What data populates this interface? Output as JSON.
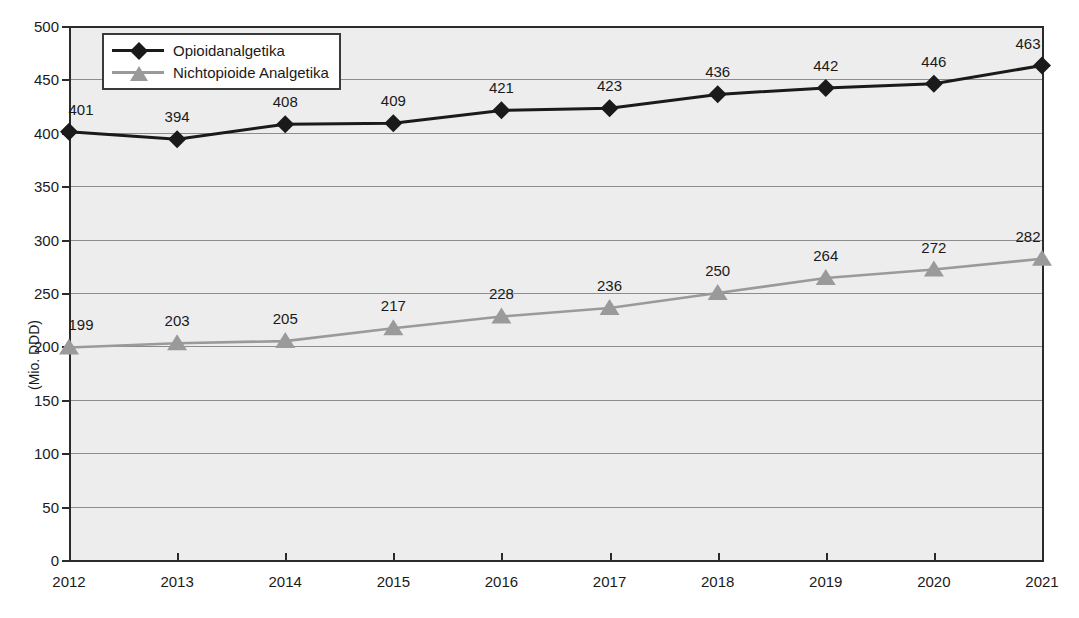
{
  "chart_data": {
    "type": "line",
    "title": "",
    "xlabel": "",
    "ylabel": "(Mio. DDD)",
    "categories": [
      "2012",
      "2013",
      "2014",
      "2015",
      "2016",
      "2017",
      "2018",
      "2019",
      "2020",
      "2021"
    ],
    "ylim": [
      0,
      500
    ],
    "yticks": [
      0,
      50,
      100,
      150,
      200,
      250,
      300,
      350,
      400,
      450,
      500
    ],
    "ytick_labels": [
      "0",
      "50",
      "100",
      "150",
      "200",
      "250",
      "300",
      "350",
      "400",
      "450",
      "500"
    ],
    "grid": true,
    "legend_position": "top-left",
    "series": [
      {
        "name": "Opioidanalgetika",
        "marker": "diamond",
        "color": "#1a1a1a",
        "values": [
          401,
          394,
          408,
          409,
          421,
          423,
          436,
          442,
          446,
          463
        ],
        "labels": [
          "401",
          "394",
          "408",
          "409",
          "421",
          "423",
          "436",
          "442",
          "446",
          "463"
        ]
      },
      {
        "name": "Nichtopioide Analgetika",
        "marker": "triangle",
        "color": "#9a9a9a",
        "values": [
          199,
          203,
          205,
          217,
          228,
          236,
          250,
          264,
          272,
          282
        ],
        "labels": [
          "199",
          "203",
          "205",
          "217",
          "228",
          "236",
          "250",
          "264",
          "272",
          "282"
        ]
      }
    ]
  },
  "legend": {
    "items": [
      {
        "label": "Opioidanalgetika"
      },
      {
        "label": "Nichtopioide Analgetika"
      }
    ]
  },
  "axes": {
    "y_axis_title": "(Mio. DDD)"
  }
}
